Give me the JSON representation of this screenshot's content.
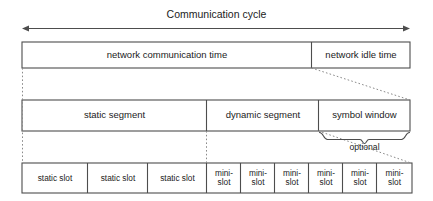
{
  "diagram": {
    "title": "Communication cycle",
    "cycle_axis": {
      "name": "communication-cycle-arrow",
      "label": "Communication cycle",
      "left_arrow": "◄",
      "right_arrow": "►"
    },
    "rows": [
      {
        "id": "row-cycle",
        "cells": [
          {
            "id": "network-communication-time",
            "label": "network communication time"
          },
          {
            "id": "network-idle-time",
            "label": "network idle time"
          }
        ]
      },
      {
        "id": "row-segments",
        "cells": [
          {
            "id": "static-segment",
            "label": "static segment"
          },
          {
            "id": "dynamic-segment",
            "label": "dynamic segment"
          },
          {
            "id": "symbol-window",
            "label": "symbol window"
          }
        ]
      },
      {
        "id": "row-slots",
        "cells": [
          {
            "id": "static-slot-1",
            "label": "static slot"
          },
          {
            "id": "static-slot-2",
            "label": "static slot"
          },
          {
            "id": "static-slot-3",
            "label": "static slot"
          },
          {
            "id": "mini-slot-1",
            "label_line1": "mini-",
            "label_line2": "slot"
          },
          {
            "id": "mini-slot-2",
            "label_line1": "mini-",
            "label_line2": "slot"
          },
          {
            "id": "mini-slot-3",
            "label_line1": "mini-",
            "label_line2": "slot"
          },
          {
            "id": "mini-slot-4",
            "label_line1": "mini-",
            "label_line2": "slot"
          },
          {
            "id": "mini-slot-5",
            "label_line1": "mini-",
            "label_line2": "slot"
          },
          {
            "id": "mini-slot-6",
            "label_line1": "mini-",
            "label_line2": "slot"
          }
        ]
      }
    ],
    "annotations": [
      {
        "id": "optional-brace-label",
        "label": "optional"
      }
    ],
    "colors": {
      "stroke": "#4d4d4d",
      "text": "#1b1b1b",
      "background": "#ffffff",
      "guide": "#8a8a8a"
    }
  }
}
